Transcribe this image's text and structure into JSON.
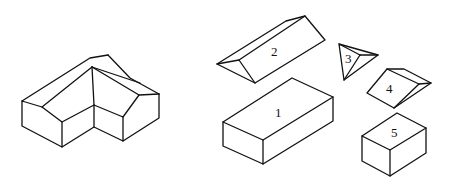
{
  "diagram": {
    "assembled": {
      "label": "assembled-house"
    },
    "parts": [
      {
        "id": "1",
        "label": "1",
        "shape": "rectangular box (main body)"
      },
      {
        "id": "2",
        "label": "2",
        "shape": "triangular prism (gable roof)"
      },
      {
        "id": "3",
        "label": "3",
        "shape": "tetrahedron (roof junction)"
      },
      {
        "id": "4",
        "label": "4",
        "shape": "wedge (wing roof)"
      },
      {
        "id": "5",
        "label": "5",
        "shape": "small box (wing body)"
      }
    ],
    "colors": {
      "stroke": "#111111",
      "background": "#ffffff"
    }
  }
}
